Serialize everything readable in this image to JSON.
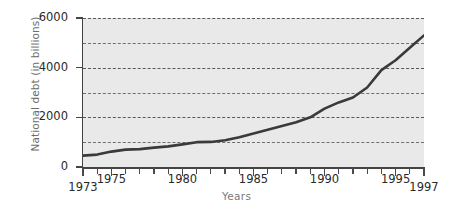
{
  "chart_data": {
    "type": "line",
    "title": "",
    "xlabel": "Years",
    "ylabel": "National debt (in billions)",
    "xlim": [
      1973,
      1997
    ],
    "ylim": [
      0,
      6000
    ],
    "grid": true,
    "legend": null,
    "y_ticks": [
      0,
      2000,
      4000,
      6000
    ],
    "y_tick_labels": [
      "0",
      "2000",
      "4000",
      "6000"
    ],
    "y_gridlines": [
      1000,
      2000,
      3000,
      4000,
      5000,
      6000
    ],
    "x_ticks": [
      1973,
      1974,
      1975,
      1976,
      1977,
      1978,
      1979,
      1980,
      1981,
      1982,
      1983,
      1984,
      1985,
      1986,
      1987,
      1988,
      1989,
      1990,
      1991,
      1992,
      1993,
      1994,
      1995,
      1996,
      1997
    ],
    "x_tick_labels": [
      "1973",
      "1975",
      "1980",
      "1985",
      "1990",
      "1995",
      "1997"
    ],
    "x_labeled_ticks": [
      1973,
      1975,
      1980,
      1985,
      1990,
      1995,
      1997
    ],
    "series": [
      {
        "name": "National debt",
        "color": "#3a3a3a",
        "x": [
          1973,
          1974,
          1975,
          1976,
          1977,
          1978,
          1979,
          1980,
          1981,
          1982,
          1983,
          1984,
          1985,
          1986,
          1987,
          1988,
          1989,
          1990,
          1991,
          1992,
          1993,
          1994,
          1995,
          1996,
          1997
        ],
        "values": [
          460,
          500,
          620,
          700,
          720,
          780,
          830,
          910,
          1000,
          1010,
          1080,
          1200,
          1350,
          1500,
          1650,
          1800,
          2000,
          2350,
          2600,
          2800,
          3200,
          3900,
          4300,
          4800,
          5300
        ]
      }
    ]
  },
  "labels": {
    "y_axis_title": "National debt (in billions)",
    "x_axis_title": "Years"
  }
}
